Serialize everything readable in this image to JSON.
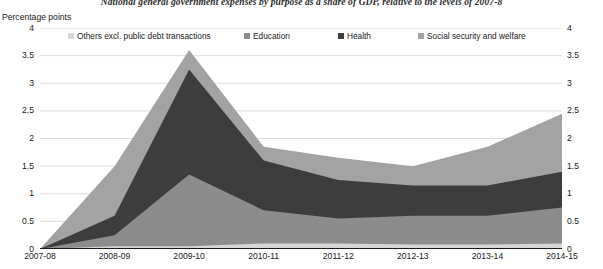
{
  "chart_title": "National general government expenses by purpose as a share of GDP, relative to the levels of 2007-8",
  "axis_unit_label": "Percentage points",
  "legend": {
    "items": [
      {
        "label": "Others excl. public debt transactions",
        "color": "#d6d6d6"
      },
      {
        "label": "Education",
        "color": "#8c8c8c"
      },
      {
        "label": "Health",
        "color": "#3d3d3d"
      },
      {
        "label": "Social security and welfare",
        "color": "#a3a3a3"
      }
    ]
  },
  "chart_data": {
    "type": "area",
    "stacked": true,
    "title": "National general government expenses by purpose as a share of GDP, relative to the levels of 2007-8",
    "xlabel": "",
    "ylabel": "Percentage points",
    "ylim": [
      0,
      4
    ],
    "ytick_labels": [
      "0",
      "0.5",
      "1",
      "1.5",
      "2",
      "2.5",
      "3",
      "3.5",
      "4"
    ],
    "ytick_values": [
      0,
      0.5,
      1,
      1.5,
      2,
      2.5,
      3,
      3.5,
      4
    ],
    "grid": true,
    "legend_position": "top",
    "categories": [
      "2007-08",
      "2008-09",
      "2009-10",
      "2010-11",
      "2011-12",
      "2012-13",
      "2013-14",
      "2014-15"
    ],
    "series": [
      {
        "name": "Others excl. public debt transactions",
        "color": "#d6d6d6",
        "values": [
          0,
          0.05,
          0.05,
          0.1,
          0.1,
          0.08,
          0.08,
          0.1
        ]
      },
      {
        "name": "Education",
        "color": "#8c8c8c",
        "values": [
          0,
          0.2,
          1.3,
          0.6,
          0.45,
          0.52,
          0.52,
          0.65
        ]
      },
      {
        "name": "Health",
        "color": "#3d3d3d",
        "values": [
          0,
          0.35,
          1.9,
          0.9,
          0.7,
          0.55,
          0.55,
          0.65
        ]
      },
      {
        "name": "Social security and welfare",
        "color": "#a3a3a3",
        "values": [
          0,
          0.9,
          0.35,
          0.25,
          0.4,
          0.35,
          0.7,
          1.05
        ]
      }
    ],
    "cumulative_tops": {
      "Others excl. public debt transactions": [
        0,
        0.05,
        0.05,
        0.1,
        0.1,
        0.08,
        0.08,
        0.1
      ],
      "Education": [
        0,
        0.25,
        1.35,
        0.7,
        0.55,
        0.6,
        0.6,
        0.75
      ],
      "Health": [
        0,
        0.6,
        3.25,
        1.6,
        1.25,
        1.15,
        1.15,
        1.4
      ],
      "Social security and welfare": [
        0,
        1.5,
        3.6,
        1.85,
        1.65,
        1.5,
        1.85,
        2.45
      ]
    }
  }
}
